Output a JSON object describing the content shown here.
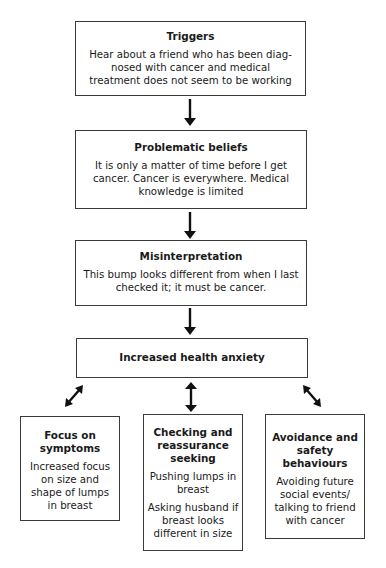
{
  "diagram": {
    "nodes": [
      {
        "id": "triggers",
        "title": "Triggers",
        "text": [
          "Hear about a friend who has been diag-nosed with cancer and medical treatment does not seem to be working"
        ]
      },
      {
        "id": "beliefs",
        "title": "Problematic beliefs",
        "text": [
          "It is only a matter of time before I get cancer. Cancer is everywhere. Medical knowledge is limited"
        ]
      },
      {
        "id": "misinterpretation",
        "title": "Misinterpretation",
        "text": [
          "This bump looks different from when I last checked it; it must be cancer."
        ]
      },
      {
        "id": "anxiety",
        "title": "Increased health anxiety",
        "text": []
      },
      {
        "id": "focus",
        "title": "Focus on symptoms",
        "text": [
          "Increased focus on size and shape of lumps in breast"
        ]
      },
      {
        "id": "checking",
        "title": "Checking and reassurance seeking",
        "text": [
          "Pushing lumps in breast",
          "Asking husband if breast looks different in size"
        ]
      },
      {
        "id": "avoidance",
        "title": "Avoidance and safety behaviours",
        "text": [
          "Avoiding future social events/ talking to friend with cancer"
        ]
      }
    ],
    "edges": [
      {
        "from": "triggers",
        "to": "beliefs",
        "type": "one-way"
      },
      {
        "from": "beliefs",
        "to": "misinterpretation",
        "type": "one-way"
      },
      {
        "from": "misinterpretation",
        "to": "anxiety",
        "type": "one-way"
      },
      {
        "from": "anxiety",
        "to": "focus",
        "type": "two-way"
      },
      {
        "from": "anxiety",
        "to": "checking",
        "type": "two-way"
      },
      {
        "from": "anxiety",
        "to": "avoidance",
        "type": "two-way"
      }
    ]
  }
}
